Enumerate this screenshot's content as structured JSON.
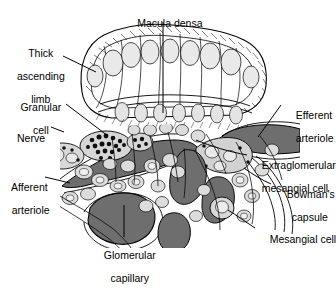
{
  "figure": {
    "background_color": "#ffffff",
    "ink_color": "#000000",
    "vessel_lumen_color": "#6e6e6e",
    "cell_cytoplasm_color": "#d8d8d8",
    "nucleus_color": "#e8e8e8",
    "granule_color": "#111111"
  },
  "labels": {
    "macula_densa": "Macula densa",
    "thick_ascending_limb_line1": "Thick",
    "thick_ascending_limb_line2": "ascending",
    "thick_ascending_limb_line3": "limb",
    "granular_cell_line1": "Granular",
    "granular_cell_line2": "cell",
    "nerve": "Nerve",
    "afferent_arteriole_line1": "Afferent",
    "afferent_arteriole_line2": "arteriole",
    "glomerular_capillary_line1": "Glomerular",
    "glomerular_capillary_line2": "capillary",
    "efferent_arteriole_line1": "Efferent",
    "efferent_arteriole_line2": "arteriole",
    "extraglomerular_mesangial_cell_line1": "Extraglomerular",
    "extraglomerular_mesangial_cell_line2": "mesangial cell",
    "bowmans_capsule_line1": "Bowman's",
    "bowmans_capsule_line2": "capsule",
    "mesangial_cell": "Mesangial cell"
  },
  "structures": [
    {
      "name": "macula-densa",
      "description": "Columnar epithelial plaque at top with brush border and oval nuclei"
    },
    {
      "name": "thick-ascending-limb",
      "description": "Tubule wall forming the upper loop"
    },
    {
      "name": "granular-cell",
      "description": "Juxtaglomerular cell cluster containing dark renin granules"
    },
    {
      "name": "nerve",
      "description": "Nerve fibers adjacent to afferent arteriole"
    },
    {
      "name": "afferent-arteriole",
      "description": "Dark-lumen vessel entering from lower left"
    },
    {
      "name": "efferent-arteriole",
      "description": "Dark-lumen vessel exiting to the right"
    },
    {
      "name": "extraglomerular-mesangial-cell",
      "description": "Cell group in the angle between arterioles"
    },
    {
      "name": "bowmans-capsule",
      "description": "Thin outer capsule layer on the right"
    },
    {
      "name": "mesangial-cell",
      "description": "Cell within the glomerular tuft, lower right"
    },
    {
      "name": "glomerular-capillary",
      "description": "Large dark capillary loop in the lower center"
    }
  ]
}
